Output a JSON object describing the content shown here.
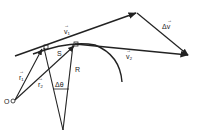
{
  "diagram": {
    "labels": {
      "v1": "v₁",
      "v2": "v₂",
      "delta_v": "Δv",
      "r1": "r₁",
      "r2": "r₂",
      "s": "S",
      "R": "R",
      "delta_theta": "Δθ",
      "origin": "O"
    },
    "vector_marker": "→",
    "colors": {
      "ink": "#222222",
      "background": "#ffffff"
    }
  }
}
